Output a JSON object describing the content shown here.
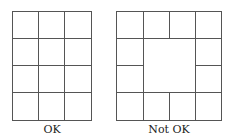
{
  "figure": {
    "left": {
      "label": "OK",
      "description": "4x3 grid of equal rectangles",
      "rows": 4,
      "cols": 3
    },
    "right": {
      "label": "Not OK",
      "description": "4x4 outer ring of rectangles with a merged 2x2 center hole",
      "rows": 4,
      "cols": 4
    },
    "line_color": "#555555"
  }
}
